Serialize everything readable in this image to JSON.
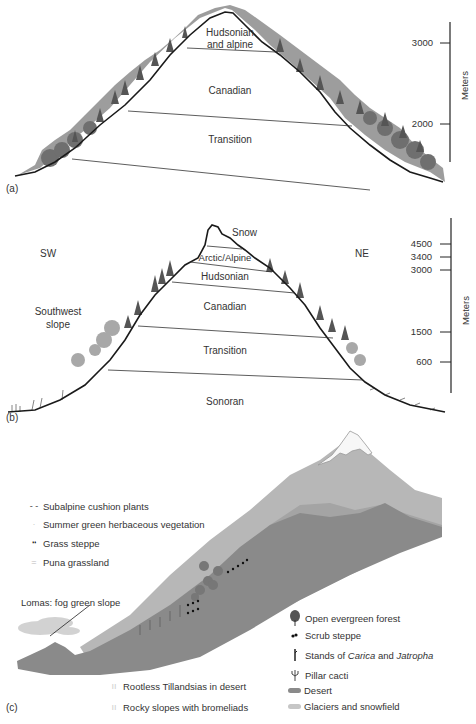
{
  "panel_a": {
    "label": "(a)",
    "zones": [
      "Hudsonian and alpine",
      "Canadian",
      "Transition"
    ],
    "zone_hudsonian_line1": "Hudsonian",
    "zone_hudsonian_line2": "and alpine",
    "zone_canadian": "Canadian",
    "zone_transition": "Transition",
    "axis": {
      "title": "Meters",
      "ticks": [
        "3000",
        "2000"
      ]
    }
  },
  "panel_b": {
    "label": "(b)",
    "direction_left": "SW",
    "direction_right": "NE",
    "slope_label_line1": "Southwest",
    "slope_label_line2": "slope",
    "zone_snow": "Snow",
    "zone_arctic": "Arctic/Alpine",
    "zone_hudsonian": "Hudsonian",
    "zone_canadian": "Canadian",
    "zone_transition": "Transition",
    "zone_sonoran": "Sonoran",
    "axis": {
      "title": "Meters",
      "ticks": [
        "4500",
        "3400",
        "3000",
        "1500",
        "600"
      ]
    }
  },
  "panel_c": {
    "label": "(c)",
    "annotation": "Lomas: fog green slope",
    "legend_left": [
      {
        "symbol": "dash-icon",
        "glyph": "- -",
        "label": "Subalpine cushion plants"
      },
      {
        "symbol": "dot-icon",
        "glyph": "·",
        "label": "Summer green herbaceous vegetation"
      },
      {
        "symbol": "grass-steppe-icon",
        "glyph": "❛❛",
        "label": "Grass steppe"
      },
      {
        "symbol": "puna-icon",
        "glyph": "=",
        "label": "Puna grassland"
      }
    ],
    "legend_bottom": [
      {
        "symbol": "tillandsia-icon",
        "glyph": "ıı",
        "label": "Rootless Tillandsias in desert"
      },
      {
        "symbol": "bromeliad-icon",
        "glyph": "ıı",
        "label": "Rocky slopes with bromeliads"
      }
    ],
    "legend_right": {
      "forest": "Open evergreen forest",
      "scrub": "Scrub steppe",
      "stands_prefix": "Stands of ",
      "stands_genus1": "Carica",
      "stands_mid": " and ",
      "stands_genus2": "Jatropha",
      "cacti": "Pillar cacti",
      "desert": "Desert",
      "glaciers": "Glaciers and snowfield"
    }
  },
  "colors": {
    "outline": "#1a1a1a",
    "vegetation_dark": "#6e6e6e",
    "vegetation_light": "#a8a8a8",
    "desert": "#8a8a8a",
    "upper_slope": "#b4b4b4",
    "snow": "#f4f4f4"
  }
}
